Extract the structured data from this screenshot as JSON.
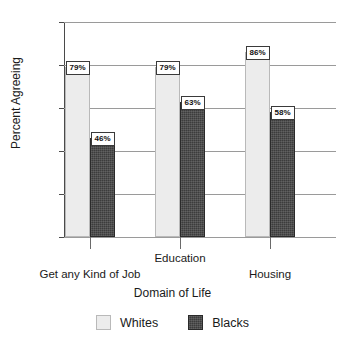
{
  "chart_data": {
    "type": "bar",
    "title": "",
    "xlabel": "Domain of Life",
    "ylabel": "Percent Agreeing",
    "categories": [
      "Get any Kind of Job",
      "Education",
      "Housing"
    ],
    "series": [
      {
        "name": "Whites",
        "values": [
          79,
          79,
          86
        ],
        "color": "#ececec"
      },
      {
        "name": "Blacks",
        "values": [
          46,
          63,
          58
        ],
        "color": "#3c3c3c"
      }
    ],
    "value_labels": [
      [
        "79%",
        "79%",
        "86%"
      ],
      [
        "46%",
        "63%",
        "58%"
      ]
    ],
    "ylim": [
      0,
      100
    ],
    "ytick_labels": [
      "0%",
      "20%",
      "40%",
      "60%",
      "80%",
      "100%"
    ],
    "ytick_values": [
      0,
      20,
      40,
      60,
      80,
      100
    ],
    "grid": true,
    "legend_position": "bottom",
    "legend": [
      "Whites",
      "Blacks"
    ],
    "staggered_category_labels": true
  }
}
